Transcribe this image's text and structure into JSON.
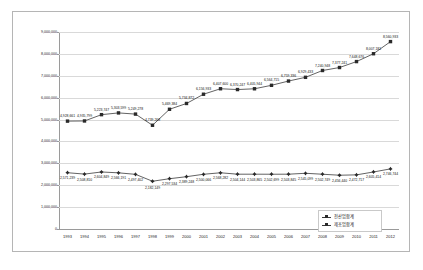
{
  "chart_data": {
    "type": "line",
    "title": "",
    "xlabel": "",
    "ylabel": "",
    "grid": true,
    "legend_position": "bottom-right",
    "ylim": [
      0,
      9000000
    ],
    "yticks": [
      "0",
      "1,000,000",
      "2,000,000",
      "3,000,000",
      "4,000,000",
      "5,000,000",
      "6,000,000",
      "7,000,000",
      "8,000,000",
      "9,000,000"
    ],
    "categories": [
      "1993",
      "1994",
      "1995",
      "1996",
      "1997",
      "1998",
      "1999",
      "2000",
      "2001",
      "2002",
      "2003",
      "2004",
      "2005",
      "2006",
      "2007",
      "2008",
      "2009",
      "2010",
      "2011",
      "2012"
    ],
    "series": [
      {
        "name": "전산업합계",
        "values": [
          4928661,
          4935799,
          5223747,
          5303599,
          5249278,
          4739268,
          5469384,
          5734872,
          6156933,
          6407600,
          6370247,
          6405944,
          6564715,
          6759336,
          6929433,
          7240948,
          7377241,
          7648676,
          8007181,
          8560933
        ],
        "labels": [
          "4,928,661",
          "4,935,799",
          "5,223,747",
          "5,303,599",
          "5,249,278",
          "4,739,268",
          "5,469,384",
          "5,734,872",
          "6,156,933",
          "6,407,600",
          "6,370,247",
          "6,405,944",
          "6,564,715",
          "6,759,336",
          "6,929,433",
          "7,240,948",
          "7,377,241",
          "7,648,676",
          "8,007,181",
          "8,560,933"
        ]
      },
      {
        "name": "제조업합계",
        "values": [
          2571239,
          2508810,
          2604849,
          2566191,
          2497402,
          2182149,
          2297534,
          2389248,
          2500066,
          2568282,
          2504144,
          2503865,
          2502699,
          2503845,
          2545099,
          2502749,
          2456440,
          2472717,
          2605414,
          2746744
        ],
        "labels": [
          "2,571,239",
          "2,508,810",
          "2,604,849",
          "2,566,191",
          "2,497,402",
          "2,182,149",
          "2,297,534",
          "2,389,248",
          "2,500,066",
          "2,568,282",
          "2,504,144",
          "2,503,865",
          "2,502,699",
          "2,503,845",
          "2,545,099",
          "2,502,749",
          "2,456,440",
          "2,472,717",
          "2,605,414",
          "2,746,744"
        ]
      }
    ],
    "colors": {
      "line": "#3b3b3b",
      "marker": "#2a2a2a",
      "grid": "#d9d9d9",
      "axis": "#9a9a9a",
      "border": "#b5b5b5"
    }
  },
  "legend": {
    "items": [
      {
        "label": "전산업합계"
      },
      {
        "label": "제조업합계"
      }
    ]
  }
}
